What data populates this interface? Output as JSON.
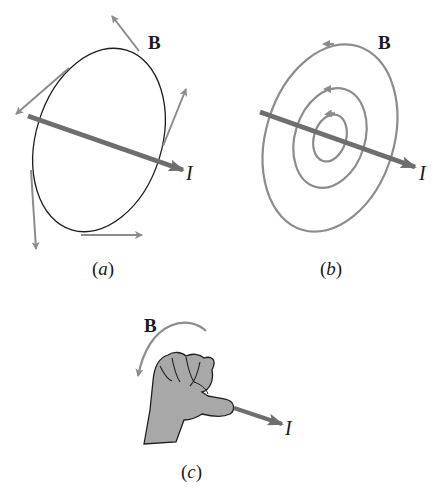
{
  "figure": {
    "panels": [
      {
        "id": "a",
        "caption_open": "(",
        "caption_letter": "a",
        "caption_close": ")",
        "field_label": "B",
        "current_label": "I",
        "description": "Single circular loop around straight current with tangent B-field vectors"
      },
      {
        "id": "b",
        "caption_open": "(",
        "caption_letter": "b",
        "caption_close": ")",
        "field_label": "B",
        "current_label": "I",
        "description": "Concentric circular B-field lines around straight current"
      },
      {
        "id": "c",
        "caption_open": "(",
        "caption_letter": "c",
        "caption_close": ")",
        "field_label": "B",
        "current_label": "I",
        "description": "Right-hand rule: thumb along current, fingers curl in B direction"
      }
    ],
    "colors": {
      "line": "#1e1e1e",
      "field": "#8c8c8c",
      "current": "#6e6e6e",
      "hand": "#a8a8a8"
    }
  }
}
